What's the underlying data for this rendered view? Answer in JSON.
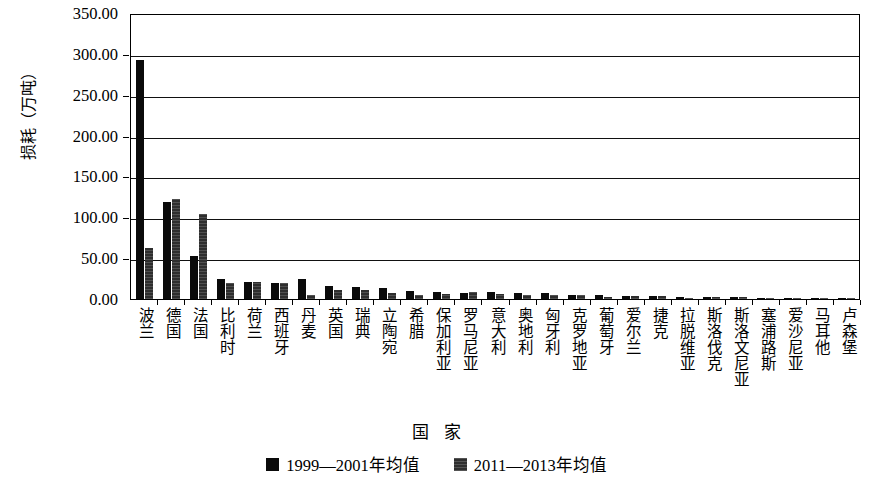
{
  "chart_data": {
    "type": "bar",
    "title": "",
    "xlabel": "国 家",
    "ylabel": "损耗（万吨）",
    "ylim": [
      0,
      350
    ],
    "ytick_step": 50,
    "ytick_labels": [
      "350.00",
      "300.00",
      "250.00",
      "200.00",
      "150.00",
      "100.00",
      "50.00",
      "0.00"
    ],
    "ytick_values": [
      350,
      300,
      250,
      200,
      150,
      100,
      50,
      0
    ],
    "grid": true,
    "legend_position": "bottom",
    "categories": [
      "波兰",
      "德国",
      "法国",
      "比利时",
      "荷兰",
      "西班牙",
      "丹麦",
      "英国",
      "瑞典",
      "立陶宛",
      "希腊",
      "保加利亚",
      "罗马尼亚",
      "意大利",
      "奥地利",
      "匈牙利",
      "克罗地亚",
      "葡萄牙",
      "爱尔兰",
      "捷克",
      "拉脱维亚",
      "斯洛伐克",
      "斯洛文尼亚",
      "塞浦路斯",
      "爱沙尼亚",
      "马耳他",
      "卢森堡"
    ],
    "series": [
      {
        "name": "1999—2001年均值",
        "color": "#0a0a0a",
        "values": [
          292.0,
          119.0,
          53.0,
          25.0,
          21.0,
          20.0,
          25.0,
          16.0,
          15.0,
          13.0,
          10.0,
          9.0,
          7.0,
          8.0,
          7.0,
          7.0,
          5.0,
          5.0,
          4.0,
          4.0,
          2.0,
          3.0,
          2.0,
          1.0,
          1.0,
          0.8,
          0.6
        ]
      },
      {
        "name": "2011—2013年均值",
        "color": "#2e2e2e",
        "values": [
          63.0,
          122.0,
          104.0,
          20.0,
          21.0,
          20.0,
          5.0,
          11.0,
          11.0,
          7.0,
          5.0,
          6.0,
          8.0,
          6.0,
          5.0,
          5.0,
          5.0,
          3.0,
          4.0,
          4.0,
          1.0,
          2.0,
          2.0,
          1.0,
          1.0,
          0.6,
          0.5
        ]
      }
    ]
  },
  "legend": {
    "items": [
      {
        "label": "1999—2001年均值"
      },
      {
        "label": "2011—2013年均值"
      }
    ]
  }
}
